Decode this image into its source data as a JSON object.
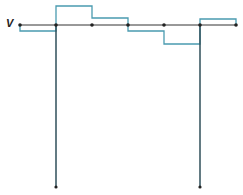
{
  "diagram": {
    "axis_label": "V",
    "colors": {
      "axis": "#333333",
      "trace": "#4a9bb0",
      "node": "#222222",
      "spike": "#2f4f5a"
    },
    "baseline_y": 25,
    "nodes_x": [
      20,
      56,
      92,
      128,
      164,
      200,
      236
    ],
    "segments": [
      {
        "x1": 20,
        "x2": 56,
        "y": 31
      },
      {
        "x1": 56,
        "x2": 92,
        "y": 6
      },
      {
        "x1": 92,
        "x2": 128,
        "y": 18
      },
      {
        "x1": 128,
        "x2": 164,
        "y": 31
      },
      {
        "x1": 164,
        "x2": 200,
        "y": 44
      },
      {
        "x1": 200,
        "x2": 236,
        "y": 19
      }
    ],
    "spikes": [
      {
        "x": 56,
        "y_bottom": 187
      },
      {
        "x": 200,
        "y_bottom": 187
      }
    ]
  }
}
